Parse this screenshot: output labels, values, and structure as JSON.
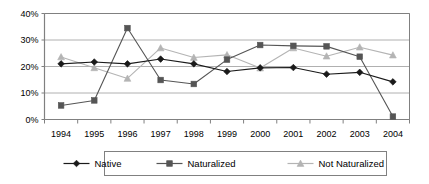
{
  "chart_data": {
    "type": "line",
    "title": "",
    "subtitle": "",
    "xlabel": "",
    "ylabel": "",
    "categories": [
      "1994",
      "1995",
      "1996",
      "1997",
      "1998",
      "1999",
      "2000",
      "2001",
      "2002",
      "2003",
      "2004"
    ],
    "ytick_labels": [
      "0%",
      "10%",
      "20%",
      "30%",
      "40%"
    ],
    "ytick_values": [
      0,
      10,
      20,
      30,
      40
    ],
    "ylim": [
      0,
      40
    ],
    "grid": "horizontal",
    "legend_position": "bottom",
    "series": [
      {
        "name": "Native",
        "color": "#1a1a1a",
        "marker": "diamond",
        "values": [
          21.0,
          21.7,
          21.0,
          22.8,
          21.0,
          18.1,
          19.5,
          19.6,
          17.1,
          17.8,
          14.2
        ]
      },
      {
        "name": "Naturalized",
        "color": "#555555",
        "marker": "square",
        "values": [
          5.3,
          7.2,
          34.5,
          14.9,
          13.4,
          22.6,
          28.1,
          27.8,
          27.6,
          23.7,
          1.1
        ]
      },
      {
        "name": "Not Naturalized",
        "color": "#b4b4b4",
        "marker": "triangle",
        "values": [
          23.6,
          19.5,
          15.5,
          27.0,
          23.4,
          24.4,
          19.4,
          27.0,
          23.9,
          27.3,
          24.3
        ]
      }
    ],
    "colors": {
      "native": "#1a1a1a",
      "naturalized": "#555555",
      "not_naturalized": "#b4b4b4",
      "gridline": "#b0b0b0",
      "axis": "#808080",
      "plot_border": "#808080",
      "background": "#ffffff"
    }
  },
  "legend": {
    "items": [
      {
        "label": "Native"
      },
      {
        "label": "Naturalized"
      },
      {
        "label": "Not Naturalized"
      }
    ]
  }
}
